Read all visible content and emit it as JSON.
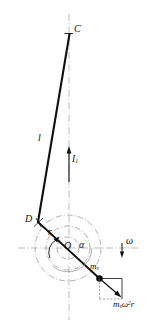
{
  "figure": {
    "type": "engineering-mechanism-diagram",
    "canvas": {
      "width": 153,
      "height": 326
    },
    "colors": {
      "stroke": "#111111",
      "centerline": "#9a9a9a",
      "circle": "#8c8c8c",
      "background": "#ffffff"
    },
    "points": {
      "C": {
        "x": 69,
        "y": 34,
        "label": "C"
      },
      "D": {
        "x": 38,
        "y": 222,
        "label": "D"
      },
      "O": {
        "x": 68,
        "y": 248,
        "label": "O"
      },
      "ms": {
        "x": 99,
        "y": 278,
        "label": "m"
      }
    },
    "labels": {
      "point_c": "C",
      "connecting_rod": "l",
      "inertia_force": "I",
      "inertia_force_sub": "1",
      "point_d": "D",
      "crank_radius": "r",
      "center_o": "O",
      "crank_angle": "α",
      "angular_velocity": "ω",
      "slider_mass": "m",
      "slider_mass_sub": "s",
      "centrifugal_force_m": "m",
      "centrifugal_force_sub": "s",
      "centrifugal_force_omega": "ω",
      "centrifugal_force_exp": "2",
      "centrifugal_force_r": "r"
    },
    "circles": [
      {
        "name": "outer-dashdot-circle",
        "cx": 68,
        "cy": 248,
        "r": 33
      },
      {
        "name": "middle-dashdot-circle",
        "cx": 68,
        "cy": 248,
        "r": 22
      },
      {
        "name": "inner-dashdot-circle",
        "cx": 68,
        "cy": 248,
        "r": 11
      }
    ],
    "axes": {
      "vertical": {
        "x": 69,
        "y1": 14,
        "y2": 320
      },
      "horizontal": {
        "y": 248,
        "x1": 18,
        "x2": 140
      }
    },
    "links": [
      {
        "name": "rod-CD",
        "x1": 69,
        "y1": 34,
        "x2": 38,
        "y2": 222
      },
      {
        "name": "crank-D-to-slider",
        "x1": 38,
        "y1": 222,
        "x2": 99,
        "y2": 278
      }
    ],
    "arrows": [
      {
        "name": "inertia-force-I1-arrow",
        "x1": 69,
        "y1": 182,
        "x2": 69,
        "y2": 148,
        "direction": "up"
      },
      {
        "name": "angular-velocity-omega-arrow",
        "x1": 122,
        "y1": 243,
        "x2": 122,
        "y2": 256,
        "direction": "down"
      },
      {
        "name": "crank-angle-arc-arrow",
        "note": "arc from crank line to horizontal axis at O"
      },
      {
        "name": "radius-r-arrow",
        "x1": 52,
        "y1": 243,
        "x2": 59,
        "y2": 236,
        "direction": "up-right"
      },
      {
        "name": "centrifugal-force-arrow",
        "x1": 99,
        "y1": 278,
        "x2": 121,
        "y2": 297,
        "direction": "down-right"
      },
      {
        "name": "force-horizontal-component",
        "x1": 99,
        "y1": 278,
        "x2": 122,
        "y2": 278,
        "direction": "right"
      },
      {
        "name": "force-vertical-component",
        "x1": 122,
        "y1": 278,
        "x2": 122,
        "y2": 298,
        "direction": "down"
      }
    ]
  }
}
